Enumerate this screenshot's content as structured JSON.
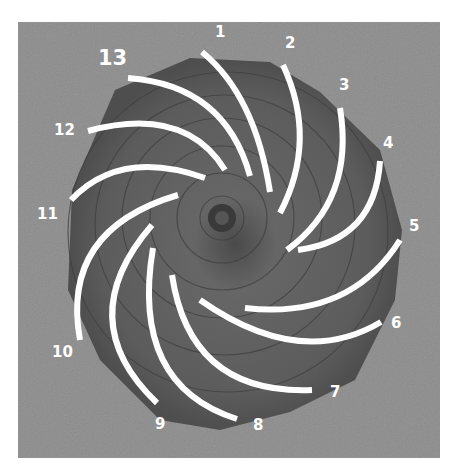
{
  "figure": {
    "background_color": "#8a8a8a",
    "cone_color": "#5e5e5e",
    "line_color": "#ffffff"
  },
  "labels": [
    {
      "text": "1",
      "x": 215,
      "y": 34
    },
    {
      "text": "2",
      "x": 285,
      "y": 42
    },
    {
      "text": "3",
      "x": 339,
      "y": 76
    },
    {
      "text": "4",
      "x": 383,
      "y": 136
    },
    {
      "text": "5",
      "x": 409,
      "y": 212
    },
    {
      "text": "6",
      "x": 391,
      "y": 313
    },
    {
      "text": "7",
      "x": 330,
      "y": 390
    },
    {
      "text": "8",
      "x": 252,
      "y": 417
    },
    {
      "text": "9",
      "x": 155,
      "y": 416
    },
    {
      "text": "10",
      "x": 52,
      "y": 347
    },
    {
      "text": "11",
      "x": 38,
      "y": 205
    },
    {
      "text": "12",
      "x": 54,
      "y": 121
    },
    {
      "text": "13",
      "x": 98,
      "y": 49
    }
  ]
}
